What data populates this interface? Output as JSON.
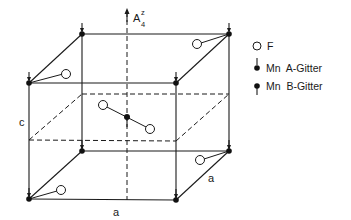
{
  "diagram": {
    "type": "crystal-structure-unit-cell",
    "axis_label": {
      "base": "A",
      "superscript": "z",
      "subscript": "4"
    },
    "edge_labels": {
      "vertical": "c",
      "front_bottom": "a",
      "side_bottom": "a"
    },
    "legend": [
      {
        "symbol": "open-circle",
        "label": "F"
      },
      {
        "symbol": "mn-spin-down-above",
        "label": "Mn  A-Gitter"
      },
      {
        "symbol": "mn-spin-down-below",
        "label": "Mn  B-Gitter"
      }
    ],
    "atoms": {
      "corner_mn": "Mn A-Gitter",
      "center_mn": "Mn B-Gitter",
      "ligand": "F"
    }
  }
}
